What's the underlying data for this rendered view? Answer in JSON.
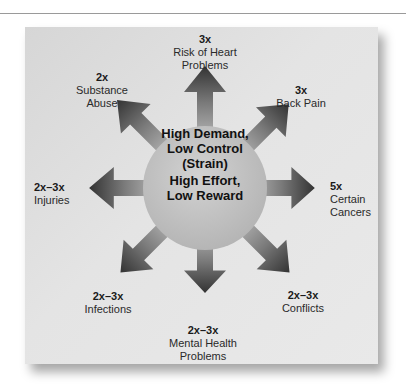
{
  "center": {
    "lines": [
      "High Demand,",
      "Low Control",
      "(Strain)",
      "High Effort,",
      "Low Reward"
    ]
  },
  "outcomes": [
    {
      "direction": "up",
      "multiplier": "3x",
      "label_lines": [
        "Risk of Heart",
        "Problems"
      ]
    },
    {
      "direction": "up-right",
      "multiplier": "3x",
      "label_lines": [
        "Back Pain"
      ]
    },
    {
      "direction": "right",
      "multiplier": "5x",
      "label_lines": [
        "Certain",
        "Cancers"
      ]
    },
    {
      "direction": "down-right",
      "multiplier": "2x–3x",
      "label_lines": [
        "Conflicts"
      ]
    },
    {
      "direction": "down",
      "multiplier": "2x–3x",
      "label_lines": [
        "Mental Health",
        "Problems"
      ]
    },
    {
      "direction": "down-left",
      "multiplier": "2x–3x",
      "label_lines": [
        "Infections"
      ]
    },
    {
      "direction": "left",
      "multiplier": "2x–3x",
      "label_lines": [
        "Injuries"
      ]
    },
    {
      "direction": "up-left",
      "multiplier": "2x",
      "label_lines": [
        "Substance",
        "Abuse"
      ]
    }
  ],
  "colors": {
    "background": "#ffffff",
    "card": "#e2e2e2",
    "circle": "#bdbdbd",
    "arrow_dark": "#3a3a3a",
    "arrow_light": "#bcbcbc"
  }
}
